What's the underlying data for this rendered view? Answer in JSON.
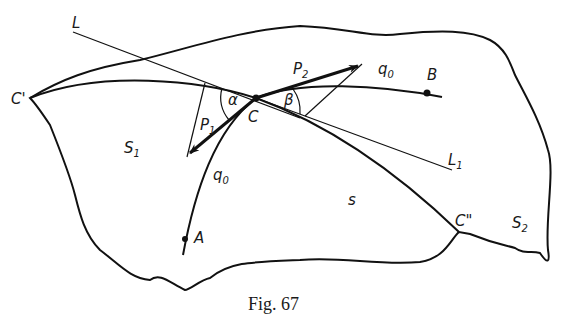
{
  "figure": {
    "caption": "Fig. 67",
    "regions": {
      "s1": {
        "main": "S",
        "sub": "1"
      },
      "s2": {
        "main": "S",
        "sub": "2"
      }
    },
    "points": {
      "C": "C",
      "C_prime": "C'",
      "C_double_prime": "C\"",
      "A": "A",
      "B": "B"
    },
    "lines": {
      "L": "L",
      "L1": {
        "main": "L",
        "sub": "1"
      },
      "s": "s"
    },
    "curves": {
      "q0_lower": {
        "main": "q",
        "sub": "0"
      },
      "q0_upper": {
        "main": "q",
        "sub": "0"
      }
    },
    "vectors": {
      "P1": {
        "main": "P",
        "sub": "1"
      },
      "P2": {
        "main": "P",
        "sub": "2"
      }
    },
    "angles": {
      "alpha": "α",
      "beta": "β"
    }
  }
}
